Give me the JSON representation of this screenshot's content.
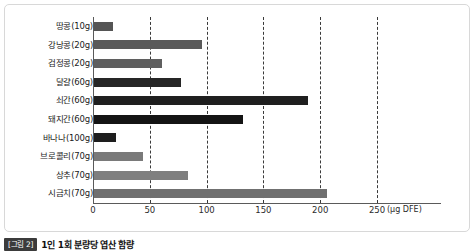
{
  "caption": {
    "badge": "[그림 2]",
    "text": "1인 1회 분량당 엽산 함량"
  },
  "chart_data": {
    "type": "bar",
    "orientation": "horizontal",
    "title": "1인 1회 분량당 엽산 함량",
    "xlabel": "(µg DFE)",
    "ylabel": "",
    "xlim": [
      0,
      260
    ],
    "grid": true,
    "legend": "none",
    "unit": "(µg DFE)",
    "tick_labels": [
      "0",
      "50",
      "100",
      "150",
      "200",
      "250"
    ],
    "tick_values": [
      0,
      50,
      100,
      150,
      200,
      250
    ],
    "gridline_values": [
      50,
      100,
      150,
      200,
      250
    ],
    "categories": [
      "땅콩(10g)",
      "강낭콩(20g)",
      "검정콩(20g)",
      "달걀(60g)",
      "쇠간(60g)",
      "돼지간(60g)",
      "바나나(100g)",
      "브로콜리(70g)",
      "상추(70g)",
      "시금치(70g)"
    ],
    "values": [
      17,
      95,
      60,
      77,
      188,
      131,
      19,
      43,
      83,
      205
    ],
    "bar_colors": [
      "#555555",
      "#5a5a5a",
      "#5f5f5f",
      "#262626",
      "#1f1f1f",
      "#141414",
      "#1e1e1e",
      "#7a7a7a",
      "#7f7f7f",
      "#707070"
    ]
  },
  "colors": {
    "frame": "#d8d8d8",
    "axis": "#5a5a5a",
    "grid": "#3a3a3a",
    "background": "#ffffff",
    "badge": "#3b3b3b"
  }
}
